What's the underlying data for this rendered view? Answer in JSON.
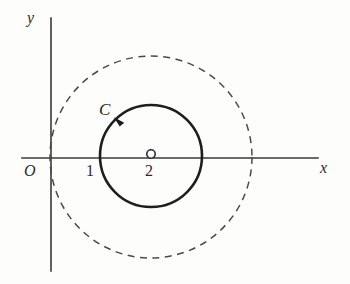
{
  "figure": {
    "background_color": "#fdfdfc",
    "width": 350,
    "height": 284
  },
  "axes": {
    "x_label": "x",
    "y_label": "y",
    "origin_label": "O",
    "x_axis": {
      "x1": 22,
      "y1": 158,
      "x2": 318,
      "y2": 158,
      "color": "#3a3a3a"
    },
    "y_axis": {
      "x1": 51,
      "y1": 18,
      "x2": 51,
      "y2": 271,
      "color": "#3a3a3a"
    }
  },
  "ticks": [
    {
      "label": "1",
      "x": 101,
      "y": 158
    },
    {
      "label": "2",
      "x": 151,
      "y": 158
    }
  ],
  "center_marker": {
    "name": "point-2",
    "cx": 151,
    "cy": 154,
    "r": 4.2,
    "fill": "#ffffff",
    "stroke": "#2b2b2b"
  },
  "contour": {
    "label": "C",
    "cx": 151,
    "cy": 156,
    "r": 51,
    "stroke": "#1e1e1e",
    "stroke_width": 2.6,
    "orientation": "counterclockwise",
    "arrow": {
      "x": 117,
      "y": 121,
      "angle_deg": 230
    }
  },
  "outer_circle": {
    "cx": 151,
    "cy": 157,
    "r": 101,
    "stroke": "#4a4a4a",
    "stroke_width": 1.5,
    "dash": "7 5.5",
    "style": "dashed"
  },
  "chart_data": {
    "type": "scatter",
    "xlabel": "x",
    "ylabel": "y",
    "grid": false,
    "legend": null,
    "xlim": [
      -1,
      6
    ],
    "ylim": [
      -3,
      3
    ],
    "annotations": [
      {
        "text": "O",
        "meaning": "origin"
      },
      {
        "text": "1",
        "meaning": "x = 1, left intersection of contour C with real axis"
      },
      {
        "text": "2",
        "meaning": "x = 2, center of contour C"
      },
      {
        "text": "C",
        "meaning": "solid contour circle, traversed counterclockwise"
      }
    ],
    "shapes": [
      {
        "kind": "circle",
        "name": "contour-C",
        "center": [
          2,
          0
        ],
        "radius": 1,
        "style": "solid",
        "direction": "counterclockwise"
      },
      {
        "kind": "circle",
        "name": "outer-dashed-circle",
        "center": [
          2,
          0
        ],
        "radius": 2,
        "style": "dashed",
        "direction": null
      },
      {
        "kind": "point",
        "name": "center-point",
        "center": [
          2,
          0
        ],
        "style": "open-circle"
      }
    ]
  }
}
